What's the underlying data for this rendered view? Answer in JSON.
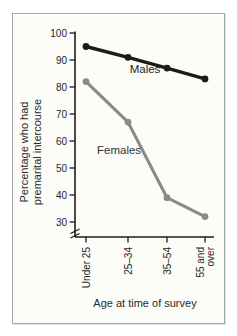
{
  "figure_frame": {
    "background": "#fcfcf9",
    "border_color": "#a6a6a6"
  },
  "chart_data": {
    "type": "line",
    "categories": [
      "Under 25",
      "25–34",
      "35–54",
      "55 and over"
    ],
    "category_label_lines": [
      [
        "Under 25"
      ],
      [
        "25–34"
      ],
      [
        "35–54"
      ],
      [
        "55 and",
        "over"
      ]
    ],
    "series": [
      {
        "name": "Males",
        "values": [
          95,
          91,
          87,
          83
        ],
        "color": "#1b1b1b",
        "marker": "circle"
      },
      {
        "name": "Females",
        "values": [
          82,
          67,
          39,
          32
        ],
        "color": "#8a8a8a",
        "marker": "circle"
      }
    ],
    "xlabel": "Age at time of survey",
    "ylabel": "Percentage who had premarital intercourse",
    "ylabel_lines": [
      "Percentage who had",
      "premarital intercourse"
    ],
    "yticks": [
      100,
      90,
      80,
      70,
      60,
      50,
      40,
      30
    ],
    "ylim": [
      30,
      100
    ],
    "y_axis_break": true,
    "grid": false,
    "legend": "inline-series-labels",
    "axis_color": "#1d1d1d",
    "text_color": "#262626"
  }
}
